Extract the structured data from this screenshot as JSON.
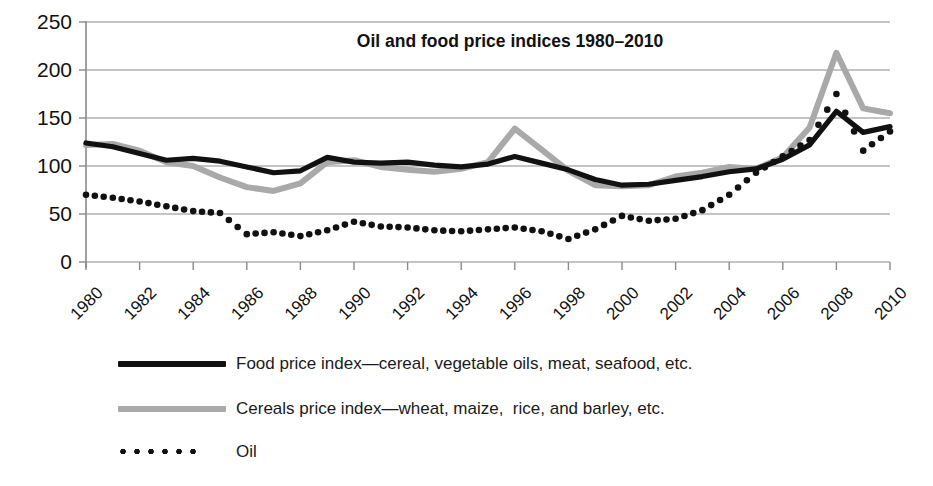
{
  "chart_data": {
    "type": "line",
    "title": "Oil and food price indices 1980–2010",
    "xlabel": "",
    "ylabel": "",
    "ylim": [
      0,
      250
    ],
    "yticks": [
      0,
      50,
      100,
      150,
      200,
      250
    ],
    "xlim": [
      1980,
      2010
    ],
    "xticks": [
      1980,
      1982,
      1984,
      1986,
      1988,
      1990,
      1992,
      1994,
      1996,
      1998,
      2000,
      2002,
      2004,
      2006,
      2008,
      2010
    ],
    "xtick_labels": [
      "1980",
      "1982",
      "1984",
      "1986",
      "1988",
      "1990",
      "1992",
      "1994",
      "1996",
      "1998",
      "2000",
      "2002",
      "2004",
      "2006",
      "2008",
      "2010"
    ],
    "grid": true,
    "legend_position": "below",
    "x": [
      1980,
      1981,
      1982,
      1983,
      1984,
      1985,
      1986,
      1987,
      1988,
      1989,
      1990,
      1991,
      1992,
      1993,
      1994,
      1995,
      1996,
      1997,
      1998,
      1999,
      2000,
      2001,
      2002,
      2003,
      2004,
      2005,
      2006,
      2007,
      2008,
      2009,
      2010
    ],
    "series": [
      {
        "name": "Food price index—cereal, vegetable oils, meat, seafood, etc.",
        "style": "solid-black",
        "color": "#111111",
        "values": [
          124,
          120,
          113,
          106,
          108,
          105,
          99,
          93,
          95,
          109,
          104,
          103,
          104,
          101,
          99,
          102,
          110,
          103,
          96,
          86,
          80,
          81,
          85,
          89,
          94,
          97,
          107,
          122,
          157,
          135,
          141
        ]
      },
      {
        "name": "Cereals price index—wheat, maize,  rice, and barley, etc.",
        "style": "solid-gray",
        "color": "#a9a9a9",
        "values": [
          122,
          123,
          116,
          104,
          100,
          88,
          78,
          74,
          82,
          104,
          106,
          99,
          96,
          94,
          97,
          104,
          139,
          117,
          95,
          80,
          79,
          80,
          89,
          93,
          99,
          97,
          109,
          140,
          218,
          160,
          155
        ]
      },
      {
        "name": "Oil",
        "style": "dotted",
        "color": "#111111",
        "values": [
          70,
          67,
          63,
          58,
          53,
          51,
          29,
          31,
          27,
          33,
          42,
          37,
          36,
          33,
          32,
          34,
          36,
          32,
          24,
          34,
          48,
          43,
          45,
          54,
          70,
          93,
          110,
          127,
          175,
          116,
          136
        ]
      }
    ]
  },
  "legend": [
    {
      "label": "Food price index—cereal, vegetable oils, meat, seafood, etc.",
      "swatch": "solid-black-line-swatch"
    },
    {
      "label": "Cereals price index—wheat, maize,  rice, and barley, etc.",
      "swatch": "solid-gray-line-swatch"
    },
    {
      "label": "Oil",
      "swatch": "dotted-line-swatch"
    }
  ],
  "colors": {
    "food_line": "#111111",
    "cereals_line": "#a9a9a9",
    "oil_line": "#111111",
    "grid": "#8a8a8a",
    "axis": "#8a8a8a",
    "background": "#ffffff"
  }
}
